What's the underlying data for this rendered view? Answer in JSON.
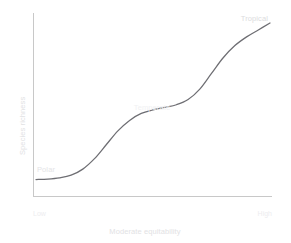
{
  "chart_data": {
    "type": "line",
    "title": "",
    "xlabel": "Moderate equitability",
    "ylabel": "Species richness",
    "xtick_labels": [
      "Low",
      "High"
    ],
    "ytick_labels": [],
    "grid": false,
    "legend": "none",
    "xlim": [
      0,
      100
    ],
    "ylim": [
      0,
      100
    ],
    "annotations": [
      {
        "text": "Polar",
        "x": 6,
        "y": 24
      },
      {
        "text": "Temperate",
        "x": 44,
        "y": 52
      },
      {
        "text": "Tropical",
        "x": 88,
        "y": 95
      }
    ],
    "series": [
      {
        "name": "species richness curve",
        "color": "#6e6e73",
        "x": [
          0,
          5,
          10,
          15,
          20,
          25,
          30,
          35,
          40,
          45,
          50,
          55,
          60,
          65,
          70,
          75,
          80,
          85,
          90,
          95,
          100
        ],
        "y": [
          6,
          6.3,
          7,
          8.5,
          12,
          18,
          26,
          34,
          40,
          44,
          46,
          47.5,
          49,
          52,
          58,
          67,
          76,
          83,
          88,
          92,
          96
        ]
      }
    ]
  },
  "axes": {
    "x_axis_name": "x-axis",
    "y_axis_name": "y-axis"
  },
  "colors": {
    "curve": "#6e6e73",
    "axis": "#c8c8c8",
    "label": "#e2e2e4",
    "background": "#ffffff"
  }
}
